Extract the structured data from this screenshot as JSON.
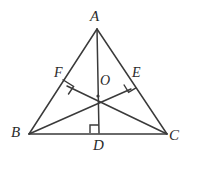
{
  "figure": {
    "name": "triangle-with-altitudes",
    "background_color": "#ffffff",
    "stroke_color": "#3a3a3a",
    "label_color": "#2b2b2b",
    "width": 197,
    "height": 171
  },
  "labels": {
    "A": "A",
    "B": "B",
    "C": "C",
    "D": "D",
    "E": "E",
    "F": "F",
    "O": "O"
  },
  "points": {
    "A": {
      "x": 97,
      "y": 29,
      "label": "A"
    },
    "B": {
      "x": 29,
      "y": 134,
      "label": "B"
    },
    "C": {
      "x": 167,
      "y": 134,
      "label": "C"
    },
    "D": {
      "x": 99,
      "y": 133,
      "label": "D"
    },
    "E": {
      "x": 131,
      "y": 89,
      "label": "E"
    },
    "F": {
      "x": 67,
      "y": 86,
      "label": "F"
    },
    "O": {
      "x": 98,
      "y": 96,
      "label": "O"
    }
  },
  "segments": [
    {
      "name": "side-AB",
      "from": "A",
      "to": "B"
    },
    {
      "name": "side-AC",
      "from": "A",
      "to": "C"
    },
    {
      "name": "side-BC",
      "from": "B",
      "to": "C"
    },
    {
      "name": "altitude-AD",
      "from": "A",
      "to": "D"
    },
    {
      "name": "altitude-BE",
      "from": "B",
      "to": "E"
    },
    {
      "name": "altitude-CF",
      "from": "C",
      "to": "F"
    }
  ],
  "right_angle_marks": [
    {
      "name": "right-angle-at-D",
      "vertex": "D"
    },
    {
      "name": "right-angle-at-E",
      "vertex": "E"
    },
    {
      "name": "right-angle-at-F",
      "vertex": "F"
    }
  ]
}
